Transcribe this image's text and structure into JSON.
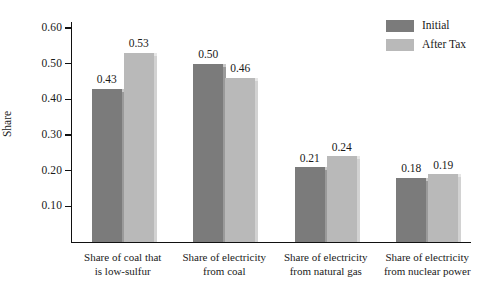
{
  "chart_data": {
    "type": "bar",
    "title": "",
    "subtitle": "",
    "xlabel": "",
    "ylabel": "Share",
    "ylim": [
      0.0,
      0.6
    ],
    "ytick_labels": [
      "0.60",
      "0.50",
      "0.40",
      "0.30",
      "0.20",
      "0.10"
    ],
    "ytick_values": [
      0.6,
      0.5,
      0.4,
      0.3,
      0.2,
      0.1
    ],
    "grid": false,
    "legend_position": "top-right",
    "categories": [
      "Share of coal that\nis low-sulfur",
      "Share of electricity\nfrom coal",
      "Share of electricity\nfrom natural gas",
      "Share of electricity\nfrom nuclear power"
    ],
    "series": [
      {
        "name": "Initial",
        "color": "#7b7b7b",
        "values": [
          0.43,
          0.5,
          0.21,
          0.18
        ],
        "labels": [
          "0.43",
          "0.50",
          "0.21",
          "0.18"
        ]
      },
      {
        "name": "After Tax",
        "color": "#b9b9b9",
        "values": [
          0.53,
          0.46,
          0.24,
          0.19
        ],
        "labels": [
          "0.53",
          "0.46",
          "0.24",
          "0.19"
        ]
      }
    ]
  },
  "axis": {
    "y_title": "Share",
    "ticks": [
      "0.60",
      "0.50",
      "0.40",
      "0.30",
      "0.20",
      "0.10"
    ]
  },
  "legend": {
    "items": [
      {
        "label": "Initial",
        "color": "#7b7b7b"
      },
      {
        "label": "After Tax",
        "color": "#b9b9b9"
      }
    ]
  },
  "colors": {
    "initial": "#7b7b7b",
    "after_tax": "#b9b9b9",
    "initial_edge": "#9a9a9a",
    "after_tax_edge": "#d2d2d2",
    "axis": "#111111",
    "text": "#1a1a1a",
    "background": "#ffffff"
  }
}
